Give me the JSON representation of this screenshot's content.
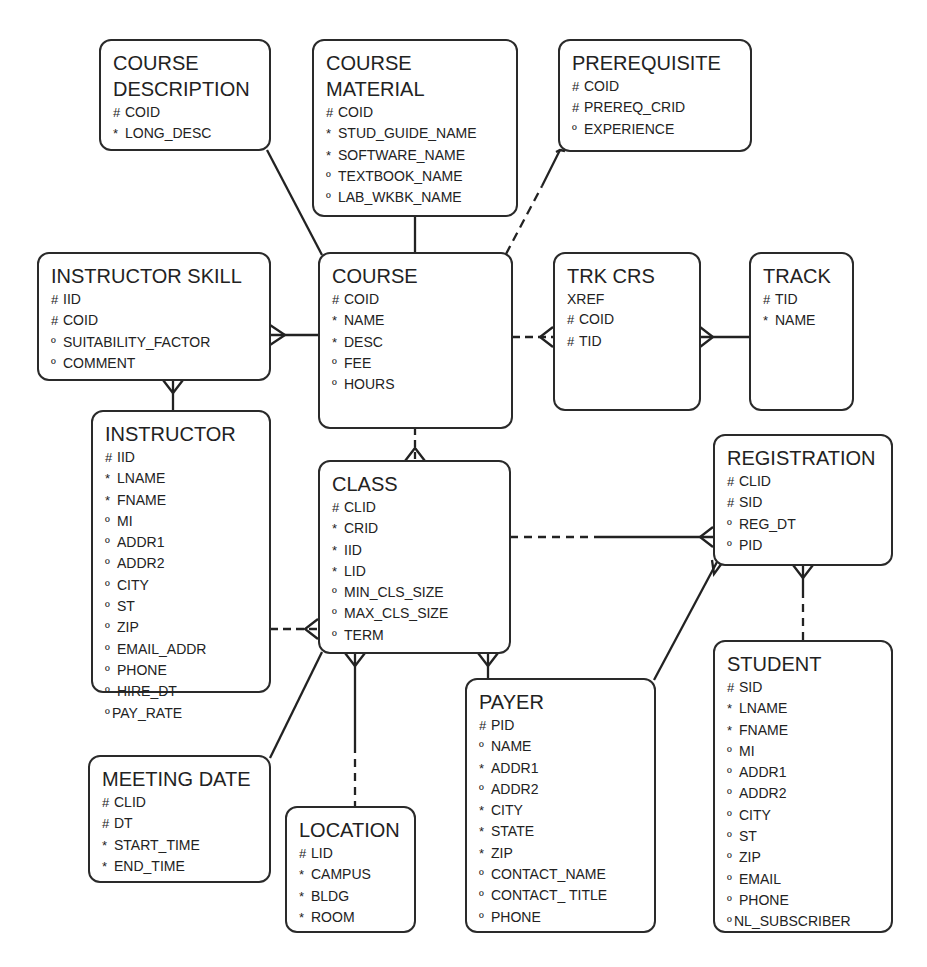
{
  "diagram": {
    "type": "entity-relationship",
    "legend_markers": {
      "#": "unique identifier",
      "*": "mandatory attribute",
      "º": "optional attribute"
    },
    "entities": {
      "course_description": {
        "title_lines": [
          "COURSE",
          "DESCRIPTION"
        ],
        "attributes": [
          {
            "mark": "#",
            "name": "COID"
          },
          {
            "mark": "*",
            "name": "LONG_DESC"
          }
        ]
      },
      "course_material": {
        "title_lines": [
          "COURSE",
          "MATERIAL"
        ],
        "attributes": [
          {
            "mark": "#",
            "name": "COID"
          },
          {
            "mark": "*",
            "name": "STUD_GUIDE_NAME"
          },
          {
            "mark": "*",
            "name": "SOFTWARE_NAME"
          },
          {
            "mark": "º",
            "name": "TEXTBOOK_NAME"
          },
          {
            "mark": "º",
            "name": "LAB_WKBK_NAME"
          }
        ]
      },
      "prerequisite": {
        "title_lines": [
          "PREREQUISITE"
        ],
        "attributes": [
          {
            "mark": "#",
            "name": "COID"
          },
          {
            "mark": "#",
            "name": "PREREQ_CRID"
          },
          {
            "mark": "º",
            "name": "EXPERIENCE"
          }
        ]
      },
      "instructor_skill": {
        "title_lines": [
          "INSTRUCTOR SKILL"
        ],
        "attributes": [
          {
            "mark": "#",
            "name": "IID"
          },
          {
            "mark": "#",
            "name": "COID"
          },
          {
            "mark": "º",
            "name": "SUITABILITY_FACTOR"
          },
          {
            "mark": "º",
            "name": "COMMENT"
          }
        ]
      },
      "course": {
        "title_lines": [
          "COURSE"
        ],
        "attributes": [
          {
            "mark": "#",
            "name": "COID"
          },
          {
            "mark": "*",
            "name": "NAME"
          },
          {
            "mark": "*",
            "name": "DESC"
          },
          {
            "mark": "º",
            "name": "FEE"
          },
          {
            "mark": "º",
            "name": "HOURS"
          }
        ]
      },
      "trk_crs_xref": {
        "title_lines": [
          "TRK CRS"
        ],
        "attributes": [
          {
            "mark": "",
            "name": "XREF"
          },
          {
            "mark": "#",
            "name": "COID"
          },
          {
            "mark": "#",
            "name": "TID"
          }
        ]
      },
      "track": {
        "title_lines": [
          "TRACK"
        ],
        "attributes": [
          {
            "mark": "#",
            "name": "TID"
          },
          {
            "mark": "*",
            "name": "NAME"
          }
        ]
      },
      "instructor": {
        "title_lines": [
          "INSTRUCTOR"
        ],
        "attributes": [
          {
            "mark": "#",
            "name": "IID"
          },
          {
            "mark": "*",
            "name": "LNAME"
          },
          {
            "mark": "*",
            "name": "FNAME"
          },
          {
            "mark": "º",
            "name": "MI"
          },
          {
            "mark": "º",
            "name": "ADDR1"
          },
          {
            "mark": "º",
            "name": "ADDR2"
          },
          {
            "mark": "º",
            "name": "CITY"
          },
          {
            "mark": "º",
            "name": "ST"
          },
          {
            "mark": "º",
            "name": "ZIP"
          },
          {
            "mark": "º",
            "name": "EMAIL_ADDR"
          },
          {
            "mark": "º",
            "name": "PHONE"
          },
          {
            "mark": "º",
            "name": "HIRE_DT"
          },
          {
            "mark": "º",
            "name": "PAY_RATE"
          }
        ]
      },
      "class": {
        "title_lines": [
          "CLASS"
        ],
        "attributes": [
          {
            "mark": "#",
            "name": "CLID"
          },
          {
            "mark": "*",
            "name": "CRID"
          },
          {
            "mark": "*",
            "name": "IID"
          },
          {
            "mark": "*",
            "name": "LID"
          },
          {
            "mark": "º",
            "name": "MIN_CLS_SIZE"
          },
          {
            "mark": "º",
            "name": "MAX_CLS_SIZE"
          },
          {
            "mark": "º",
            "name": "TERM"
          }
        ]
      },
      "registration": {
        "title_lines": [
          "REGISTRATION"
        ],
        "attributes": [
          {
            "mark": "#",
            "name": "CLID"
          },
          {
            "mark": "#",
            "name": "SID"
          },
          {
            "mark": "º",
            "name": "REG_DT"
          },
          {
            "mark": "º",
            "name": "PID"
          }
        ]
      },
      "student": {
        "title_lines": [
          "STUDENT"
        ],
        "attributes": [
          {
            "mark": "#",
            "name": "SID"
          },
          {
            "mark": "*",
            "name": "LNAME"
          },
          {
            "mark": "*",
            "name": "FNAME"
          },
          {
            "mark": "º",
            "name": "MI"
          },
          {
            "mark": "º",
            "name": "ADDR1"
          },
          {
            "mark": "º",
            "name": "ADDR2"
          },
          {
            "mark": "º",
            "name": "CITY"
          },
          {
            "mark": "º",
            "name": "ST"
          },
          {
            "mark": "º",
            "name": "ZIP"
          },
          {
            "mark": "º",
            "name": "EMAIL"
          },
          {
            "mark": "º",
            "name": "PHONE"
          },
          {
            "mark": "º",
            "name": "NL_SUBSCRIBER"
          }
        ]
      },
      "payer": {
        "title_lines": [
          "PAYER"
        ],
        "attributes": [
          {
            "mark": "#",
            "name": "PID"
          },
          {
            "mark": "º",
            "name": "NAME"
          },
          {
            "mark": "*",
            "name": "ADDR1"
          },
          {
            "mark": "º",
            "name": "ADDR2"
          },
          {
            "mark": "*",
            "name": "CITY"
          },
          {
            "mark": "*",
            "name": "STATE"
          },
          {
            "mark": "*",
            "name": "ZIP"
          },
          {
            "mark": "º",
            "name": "CONTACT_NAME"
          },
          {
            "mark": "º",
            "name": "CONTACT_ TITLE"
          },
          {
            "mark": "º",
            "name": "PHONE"
          }
        ]
      },
      "meeting_date": {
        "title_lines": [
          "MEETING DATE"
        ],
        "attributes": [
          {
            "mark": "#",
            "name": "CLID"
          },
          {
            "mark": "#",
            "name": "DT"
          },
          {
            "mark": "*",
            "name": "START_TIME"
          },
          {
            "mark": "*",
            "name": "END_TIME"
          }
        ]
      },
      "location": {
        "title_lines": [
          "LOCATION"
        ],
        "attributes": [
          {
            "mark": "#",
            "name": "LID"
          },
          {
            "mark": "*",
            "name": "CAMPUS"
          },
          {
            "mark": "*",
            "name": "BLDG"
          },
          {
            "mark": "*",
            "name": "ROOM"
          }
        ]
      }
    },
    "relationships": [
      {
        "from": "COURSE DESCRIPTION",
        "to": "COURSE",
        "style": "solid",
        "cardinality": "one-to-one"
      },
      {
        "from": "COURSE MATERIAL",
        "to": "COURSE",
        "style": "solid",
        "cardinality": "one-to-one"
      },
      {
        "from": "PREREQUISITE",
        "to": "COURSE",
        "style": "dashed/solid",
        "cardinality": "many-to-one"
      },
      {
        "from": "INSTRUCTOR SKILL",
        "to": "COURSE",
        "style": "solid",
        "cardinality": "many-to-one"
      },
      {
        "from": "INSTRUCTOR SKILL",
        "to": "INSTRUCTOR",
        "style": "solid",
        "cardinality": "many-to-one"
      },
      {
        "from": "TRK CRS XREF",
        "to": "COURSE",
        "style": "dashed",
        "cardinality": "many-to-one"
      },
      {
        "from": "TRK CRS XREF",
        "to": "TRACK",
        "style": "solid",
        "cardinality": "many-to-one"
      },
      {
        "from": "CLASS",
        "to": "COURSE",
        "style": "dashed",
        "cardinality": "many-to-one"
      },
      {
        "from": "CLASS",
        "to": "INSTRUCTOR",
        "style": "dashed",
        "cardinality": "many-to-one"
      },
      {
        "from": "CLASS",
        "to": "LOCATION",
        "style": "solid/dashed",
        "cardinality": "many-to-one"
      },
      {
        "from": "CLASS",
        "to": "MEETING DATE",
        "style": "solid",
        "cardinality": "one-to-many"
      },
      {
        "from": "CLASS",
        "to": "PAYER",
        "style": "solid",
        "cardinality": "many-to-one"
      },
      {
        "from": "REGISTRATION",
        "to": "CLASS",
        "style": "dashed/solid",
        "cardinality": "many-to-one"
      },
      {
        "from": "REGISTRATION",
        "to": "PAYER",
        "style": "solid",
        "cardinality": "many-to-one"
      },
      {
        "from": "REGISTRATION",
        "to": "STUDENT",
        "style": "solid/dashed",
        "cardinality": "many-to-one"
      }
    ]
  }
}
